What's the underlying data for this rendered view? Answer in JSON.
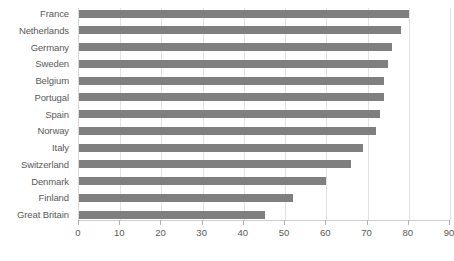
{
  "chart_data": {
    "type": "bar",
    "orientation": "horizontal",
    "title": "",
    "subtitle": "",
    "xlabel": "",
    "ylabel": "",
    "xlim": [
      0,
      90
    ],
    "ylim": null,
    "grid": true,
    "legend": null,
    "legend_position": "none",
    "xticks": [
      0,
      10,
      20,
      30,
      40,
      50,
      60,
      70,
      80,
      90
    ],
    "xtick_labels": [
      "0",
      "10",
      "20",
      "30",
      "40",
      "50",
      "60",
      "70",
      "80",
      "90"
    ],
    "categories": [
      "France",
      "Netherlands",
      "Germany",
      "Sweden",
      "Belgium",
      "Portugal",
      "Spain",
      "Norway",
      "Italy",
      "Switzerland",
      "Denmark",
      "Finland",
      "Great Britain"
    ],
    "values": [
      80,
      78,
      76,
      75,
      74,
      74,
      73,
      72,
      69,
      66,
      60,
      52,
      45
    ],
    "bar_color": "#7f7f7f",
    "gridline_color": "#e2e2e2",
    "text_color": "#595959",
    "background_color": "#ffffff"
  }
}
